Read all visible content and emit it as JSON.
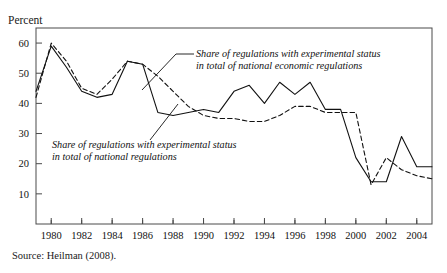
{
  "page": {
    "title_remnant": "",
    "ylabel": "Percent",
    "source": "Source: Heilman (2008)."
  },
  "annotations": {
    "economic": {
      "line1": "Share of regulations with experimental status",
      "line2": "in total of national economic regulations"
    },
    "total": {
      "line1": "Share of regulations with experimental status",
      "line2": "in total of national regulations"
    }
  },
  "chart_data": {
    "type": "line",
    "title": "",
    "xlabel": "",
    "ylabel": "Percent",
    "xlim": [
      1979,
      2005
    ],
    "ylim": [
      0,
      65
    ],
    "yticks": [
      10,
      20,
      30,
      40,
      50,
      60
    ],
    "xticks": [
      1980,
      1982,
      1984,
      1986,
      1988,
      1990,
      1992,
      1994,
      1996,
      1998,
      2000,
      2002,
      2004
    ],
    "xtick_labels": [
      "1980",
      "1982",
      "1984",
      "1986",
      "1988",
      "1990",
      "1992",
      "1994",
      "1996",
      "1998",
      "2000",
      "2002",
      "2004"
    ],
    "ytick_labels": [
      "10",
      "20",
      "30",
      "40",
      "50",
      "60"
    ],
    "grid": false,
    "legend": "annotations-inline",
    "x": [
      1979,
      1980,
      1981,
      1982,
      1983,
      1984,
      1985,
      1986,
      1987,
      1988,
      1989,
      1990,
      1991,
      1992,
      1993,
      1994,
      1995,
      1996,
      1997,
      1998,
      1999,
      2000,
      2001,
      2002,
      2003,
      2004,
      2005
    ],
    "series": [
      {
        "name": "Share of regulations with experimental status in total of national regulations",
        "style": "solid",
        "color": "#111111",
        "values": [
          44,
          59,
          52,
          44,
          42,
          43,
          54,
          53,
          37,
          36,
          37,
          38,
          37,
          44,
          46,
          40,
          47,
          43,
          47,
          38,
          38,
          22,
          14,
          14,
          29,
          19,
          19
        ]
      },
      {
        "name": "Share of regulations with experimental status in total of national economic regulations",
        "style": "dashed",
        "color": "#111111",
        "values": [
          42,
          60,
          54,
          45,
          43,
          48,
          54,
          53,
          49,
          44,
          39,
          36,
          35,
          35,
          34,
          34,
          36,
          39,
          39,
          37,
          37,
          37,
          13,
          22,
          18,
          16,
          15
        ]
      }
    ]
  }
}
